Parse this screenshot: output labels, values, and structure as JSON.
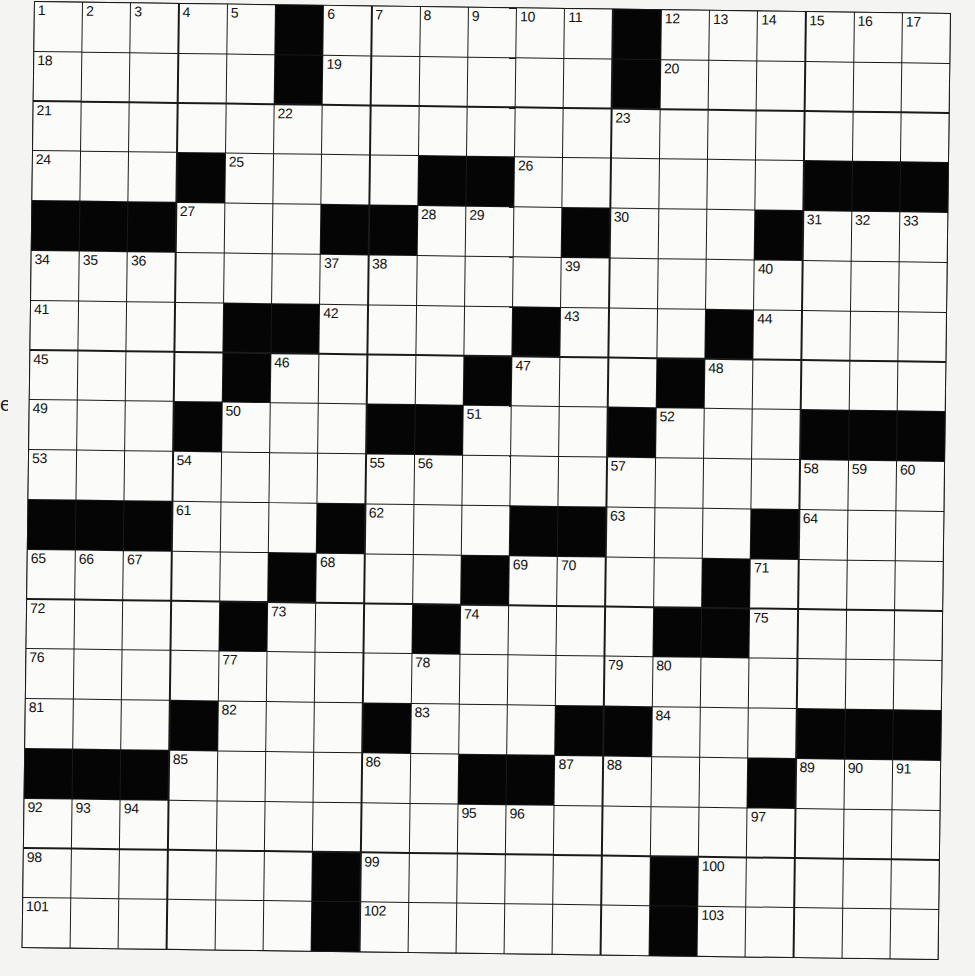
{
  "margin_text": "e",
  "puzzle": {
    "rows": 19,
    "cols": 19,
    "layout": [
      "#####.######.######",
      "#####.######.######",
      "###################",
      "###.####..######...",
      "...###..###.###.###",
      "###################",
      "####..####.###.####",
      "####.####.###.#####",
      "###.###..###.###...",
      "###################",
      "...###.###..###.###",
      "#####.###.####.####",
      "####.###.####..####",
      "###################",
      "###.###.###..###...",
      "...######..####.###",
      "###################",
      "######.######.#####",
      "######.######.#####"
    ],
    "numbers": [
      [
        0,
        0,
        1
      ],
      [
        0,
        1,
        2
      ],
      [
        0,
        2,
        3
      ],
      [
        0,
        3,
        4
      ],
      [
        0,
        4,
        5
      ],
      [
        0,
        6,
        6
      ],
      [
        0,
        7,
        7
      ],
      [
        0,
        8,
        8
      ],
      [
        0,
        9,
        9
      ],
      [
        0,
        10,
        10
      ],
      [
        0,
        11,
        11
      ],
      [
        0,
        13,
        12
      ],
      [
        0,
        14,
        13
      ],
      [
        0,
        15,
        14
      ],
      [
        0,
        16,
        15
      ],
      [
        0,
        17,
        16
      ],
      [
        0,
        18,
        17
      ],
      [
        1,
        0,
        18
      ],
      [
        1,
        6,
        19
      ],
      [
        1,
        13,
        20
      ],
      [
        2,
        0,
        21
      ],
      [
        2,
        5,
        22
      ],
      [
        2,
        12,
        23
      ],
      [
        3,
        0,
        24
      ],
      [
        3,
        4,
        25
      ],
      [
        3,
        10,
        26
      ],
      [
        4,
        3,
        27
      ],
      [
        4,
        8,
        28
      ],
      [
        4,
        9,
        29
      ],
      [
        4,
        12,
        30
      ],
      [
        4,
        16,
        31
      ],
      [
        4,
        17,
        32
      ],
      [
        4,
        18,
        33
      ],
      [
        5,
        0,
        34
      ],
      [
        5,
        1,
        35
      ],
      [
        5,
        2,
        36
      ],
      [
        5,
        6,
        37
      ],
      [
        5,
        7,
        38
      ],
      [
        5,
        11,
        39
      ],
      [
        5,
        15,
        40
      ],
      [
        6,
        0,
        41
      ],
      [
        6,
        6,
        42
      ],
      [
        6,
        11,
        43
      ],
      [
        6,
        15,
        44
      ],
      [
        7,
        0,
        45
      ],
      [
        7,
        5,
        46
      ],
      [
        7,
        10,
        47
      ],
      [
        7,
        14,
        48
      ],
      [
        8,
        0,
        49
      ],
      [
        8,
        4,
        50
      ],
      [
        8,
        9,
        51
      ],
      [
        8,
        13,
        52
      ],
      [
        9,
        0,
        53
      ],
      [
        9,
        3,
        54
      ],
      [
        9,
        7,
        55
      ],
      [
        9,
        8,
        56
      ],
      [
        9,
        12,
        57
      ],
      [
        9,
        16,
        58
      ],
      [
        9,
        17,
        59
      ],
      [
        9,
        18,
        60
      ],
      [
        10,
        3,
        61
      ],
      [
        10,
        7,
        62
      ],
      [
        10,
        12,
        63
      ],
      [
        10,
        16,
        64
      ],
      [
        11,
        0,
        65
      ],
      [
        11,
        1,
        66
      ],
      [
        11,
        2,
        67
      ],
      [
        11,
        6,
        68
      ],
      [
        11,
        10,
        69
      ],
      [
        11,
        11,
        70
      ],
      [
        11,
        15,
        71
      ],
      [
        12,
        0,
        72
      ],
      [
        12,
        5,
        73
      ],
      [
        12,
        9,
        74
      ],
      [
        12,
        15,
        75
      ],
      [
        13,
        0,
        76
      ],
      [
        13,
        4,
        77
      ],
      [
        13,
        8,
        78
      ],
      [
        13,
        12,
        79
      ],
      [
        13,
        13,
        80
      ],
      [
        14,
        0,
        81
      ],
      [
        14,
        4,
        82
      ],
      [
        14,
        8,
        83
      ],
      [
        14,
        13,
        84
      ],
      [
        15,
        3,
        85
      ],
      [
        15,
        7,
        86
      ],
      [
        15,
        11,
        87
      ],
      [
        15,
        12,
        88
      ],
      [
        15,
        16,
        89
      ],
      [
        15,
        17,
        90
      ],
      [
        15,
        18,
        91
      ],
      [
        16,
        0,
        92
      ],
      [
        16,
        1,
        93
      ],
      [
        16,
        2,
        94
      ],
      [
        16,
        9,
        95
      ],
      [
        16,
        10,
        96
      ],
      [
        16,
        15,
        97
      ],
      [
        17,
        0,
        98
      ],
      [
        17,
        7,
        99
      ],
      [
        17,
        14,
        100
      ],
      [
        18,
        0,
        101
      ],
      [
        18,
        7,
        102
      ],
      [
        18,
        14,
        103
      ]
    ]
  },
  "colors": {
    "black_square": "#050505",
    "white_square": "#fbfbf9",
    "grid_line": "#1a1a1a",
    "paper": "#f4f4f2"
  }
}
